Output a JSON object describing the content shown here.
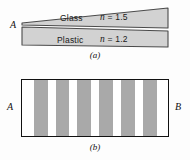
{
  "figure": {
    "background_color": "#fdfdfd",
    "panel_a": {
      "caption": "(a)",
      "vertex_label": "A",
      "slab_fill": "#d2d2d2",
      "slab_stroke": "#4a4a4a",
      "layers": [
        {
          "name": "Glass",
          "index_symbol": "n",
          "index_text": " = 1.5",
          "index_value": 1.5
        },
        {
          "name": "Plastic",
          "index_symbol": "n",
          "index_text": " = 1.2",
          "index_value": 1.2
        }
      ]
    },
    "panel_b": {
      "caption": "(b)",
      "left_label": "A",
      "right_label": "B",
      "fringe_color": "#a9a9a9",
      "gap_color": "#ffffff",
      "border_color": "#111111",
      "fringe_count": 6,
      "fringes": [
        {
          "left_pct": 8.0,
          "width_pct": 9.5
        },
        {
          "left_pct": 23.0,
          "width_pct": 9.5
        },
        {
          "left_pct": 38.0,
          "width_pct": 9.5
        },
        {
          "left_pct": 53.0,
          "width_pct": 9.5
        },
        {
          "left_pct": 68.0,
          "width_pct": 9.5
        },
        {
          "left_pct": 83.0,
          "width_pct": 9.5
        }
      ]
    }
  }
}
